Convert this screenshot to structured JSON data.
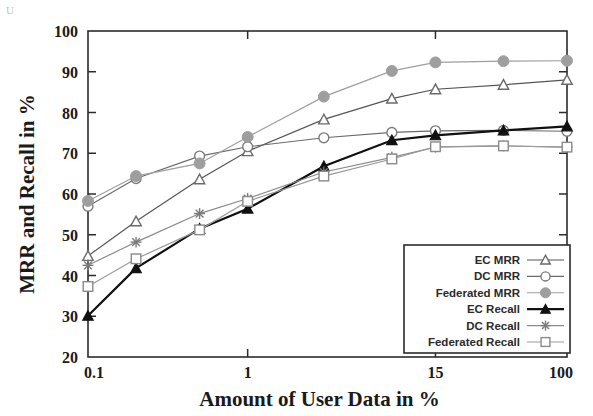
{
  "figure": {
    "background": "#ffffff",
    "artifact_glyph": "U"
  },
  "chart_data": {
    "type": "line",
    "title": "",
    "xlabel": "Amount of User Data in %",
    "ylabel": "MRR and Recall in %",
    "xscale": "log",
    "xlim": [
      0.1,
      100
    ],
    "ylim": [
      20,
      100
    ],
    "x_tick_labels": [
      "0.1",
      "1",
      "15",
      "100"
    ],
    "x_tick_values": [
      0.1,
      1,
      15,
      100
    ],
    "y_tick_labels": [
      "20",
      "30",
      "40",
      "50",
      "60",
      "70",
      "80",
      "90",
      "100"
    ],
    "y_tick_values": [
      20,
      30,
      40,
      50,
      60,
      70,
      80,
      90,
      100
    ],
    "grid": false,
    "legend_position": "lower right",
    "x": [
      0.1,
      0.2,
      0.5,
      1,
      3,
      8,
      15,
      40,
      100
    ],
    "series": [
      {
        "name": "EC MRR",
        "marker": "triangle-open",
        "color": "#6a6a6a",
        "line_color": "#555555",
        "values": [
          44.8,
          53.3,
          63.6,
          70.5,
          78.3,
          83.4,
          85.7,
          86.8,
          88.0
        ]
      },
      {
        "name": "DC MRR",
        "marker": "circle-open",
        "color": "#7a7a7a",
        "line_color": "#6a6a6a",
        "values": [
          57.0,
          63.8,
          69.3,
          71.6,
          73.8,
          75.1,
          75.5,
          75.6,
          75.4
        ]
      },
      {
        "name": "Federated MRR",
        "marker": "circle-filled",
        "color": "#9e9e9e",
        "line_color": "#9e9e9e",
        "values": [
          58.3,
          64.4,
          67.5,
          74.0,
          83.9,
          90.2,
          92.3,
          92.6,
          92.7
        ]
      },
      {
        "name": "EC Recall",
        "marker": "triangle-filled",
        "color": "#111111",
        "line_color": "#111111",
        "values": [
          30.1,
          41.8,
          51.5,
          56.4,
          66.8,
          73.2,
          74.4,
          75.6,
          76.6
        ]
      },
      {
        "name": "DC Recall",
        "marker": "asterisk",
        "color": "#7a7a7a",
        "line_color": "#8a8a8a",
        "values": [
          42.5,
          48.2,
          55.2,
          58.9,
          65.4,
          69.0,
          71.5,
          71.8,
          71.5
        ]
      },
      {
        "name": "Federated Recall",
        "marker": "square-open",
        "color": "#8a8a8a",
        "line_color": "#9a9a9a",
        "values": [
          37.3,
          44.1,
          51.2,
          58.2,
          64.4,
          68.6,
          71.6,
          71.8,
          71.5
        ]
      }
    ]
  },
  "legend": {
    "items": [
      {
        "label": "EC MRR"
      },
      {
        "label": "DC MRR"
      },
      {
        "label": "Federated MRR"
      },
      {
        "label": "EC Recall"
      },
      {
        "label": "DC Recall"
      },
      {
        "label": "Federated Recall"
      }
    ]
  }
}
